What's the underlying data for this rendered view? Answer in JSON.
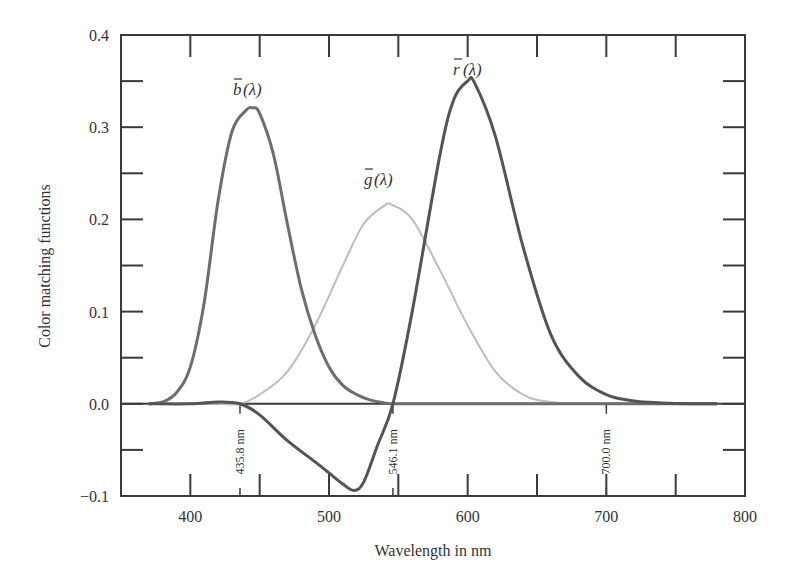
{
  "chart_data": {
    "type": "line",
    "title": "",
    "xlabel": "Wavelength in nm",
    "ylabel": "Color matching functions",
    "xlim": [
      350,
      800
    ],
    "ylim": [
      -0.1,
      0.4
    ],
    "x_ticks": [
      400,
      500,
      600,
      700,
      800
    ],
    "x_minor_ticks": [
      450,
      550,
      650,
      750
    ],
    "y_ticks": [
      "0.4",
      "0.3",
      "0.2",
      "0.1",
      "0.0",
      "−0.1"
    ],
    "y_tick_values": [
      0.4,
      0.3,
      0.2,
      0.1,
      0.0,
      -0.1
    ],
    "y_minor_ticks": [
      0.35,
      0.25,
      0.15,
      0.05,
      -0.05
    ],
    "grid": false,
    "legend": "none (curves labeled inline)",
    "annotations": [
      {
        "text": "435.8 nm",
        "x": 435.8,
        "orientation": "vertical"
      },
      {
        "text": "546.1 nm",
        "x": 546.1,
        "orientation": "vertical"
      },
      {
        "text": "700.0 nm",
        "x": 700.0,
        "orientation": "vertical"
      }
    ],
    "series": [
      {
        "name": "b̄(λ)",
        "label": "b(λ)",
        "color": "#6e6e6e",
        "x": [
          370,
          380,
          390,
          400,
          410,
          420,
          430,
          440,
          445,
          450,
          460,
          470,
          480,
          490,
          500,
          510,
          520,
          530,
          540,
          546.1,
          560,
          600,
          700,
          780
        ],
        "y": [
          0.0,
          0.002,
          0.012,
          0.04,
          0.11,
          0.22,
          0.295,
          0.318,
          0.321,
          0.315,
          0.27,
          0.195,
          0.125,
          0.075,
          0.04,
          0.02,
          0.01,
          0.004,
          0.001,
          0.0,
          0.0,
          0.0,
          0.0,
          0.0
        ]
      },
      {
        "name": "ḡ(λ)",
        "label": "g(λ)",
        "color": "#bdbdbd",
        "x": [
          370,
          400,
          420,
          435.8,
          450,
          470,
          490,
          510,
          525,
          540,
          545,
          560,
          580,
          600,
          620,
          640,
          660,
          700,
          780
        ],
        "y": [
          0.0,
          0.0,
          0.0,
          0.0,
          0.01,
          0.035,
          0.085,
          0.15,
          0.195,
          0.215,
          0.216,
          0.2,
          0.145,
          0.085,
          0.035,
          0.01,
          0.002,
          0.0,
          0.0
        ]
      },
      {
        "name": "r̄(λ)",
        "label": "r(λ)",
        "color": "#545454",
        "x": [
          370,
          400,
          420,
          435.8,
          450,
          470,
          490,
          500,
          510,
          518,
          525,
          535,
          546.1,
          560,
          580,
          590,
          600,
          605,
          620,
          640,
          660,
          680,
          700,
          720,
          740,
          760,
          780
        ],
        "y": [
          0.0,
          0.0,
          0.002,
          0.0,
          -0.012,
          -0.04,
          -0.063,
          -0.075,
          -0.087,
          -0.094,
          -0.085,
          -0.045,
          0.0,
          0.1,
          0.27,
          0.33,
          0.35,
          0.348,
          0.29,
          0.17,
          0.075,
          0.03,
          0.01,
          0.003,
          0.001,
          0.0,
          0.0
        ]
      }
    ]
  },
  "labels": {
    "b_curve": "b",
    "g_curve": "g",
    "r_curve": "r",
    "lambda_suffix": "(λ)"
  }
}
